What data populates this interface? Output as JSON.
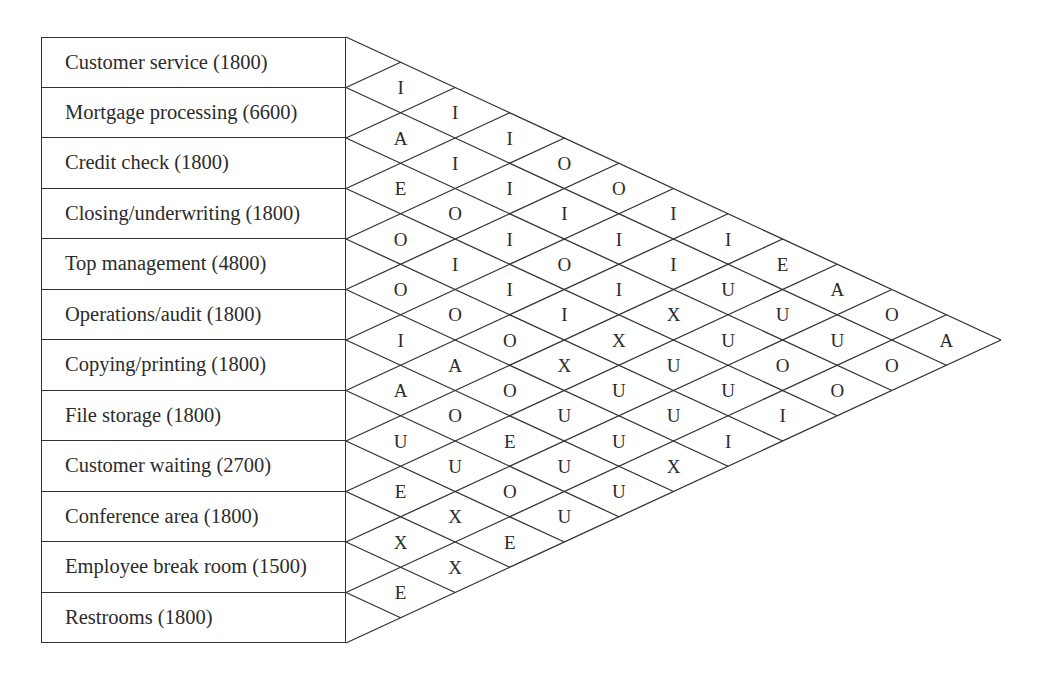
{
  "diagram": {
    "type": "activity-relationship-chart",
    "departments": [
      {
        "name": "Customer service",
        "area": 1800,
        "label": "Customer service (1800)"
      },
      {
        "name": "Mortgage processing",
        "area": 6600,
        "label": "Mortgage processing (6600)"
      },
      {
        "name": "Credit check",
        "area": 1800,
        "label": "Credit check (1800)"
      },
      {
        "name": "Closing/underwriting",
        "area": 1800,
        "label": "Closing/underwriting (1800)"
      },
      {
        "name": "Top management",
        "area": 4800,
        "label": "Top management (4800)"
      },
      {
        "name": "Operations/audit",
        "area": 1800,
        "label": "Operations/audit (1800)"
      },
      {
        "name": "Copying/printing",
        "area": 1800,
        "label": "Copying/printing (1800)"
      },
      {
        "name": "File storage",
        "area": 1800,
        "label": "File storage (1800)"
      },
      {
        "name": "Customer waiting",
        "area": 2700,
        "label": "Customer waiting (2700)"
      },
      {
        "name": "Conference area",
        "area": 1800,
        "label": "Conference area (1800)"
      },
      {
        "name": "Employee break room",
        "area": 1500,
        "label": "Employee break room (1500)"
      },
      {
        "name": "Restrooms",
        "area": 1800,
        "label": "Restrooms (1800)"
      }
    ],
    "relationships_note": "relationships[i][k] = code between department i and department i+k+1",
    "relationships": [
      [
        "I",
        "I",
        "I",
        "O",
        "O",
        "I",
        "I",
        "E",
        "A",
        "O",
        "A"
      ],
      [
        "A",
        "I",
        "I",
        "I",
        "I",
        "I",
        "U",
        "U",
        "U",
        "O"
      ],
      [
        "E",
        "O",
        "I",
        "O",
        "I",
        "X",
        "U",
        "O",
        "O"
      ],
      [
        "O",
        "I",
        "I",
        "I",
        "X",
        "U",
        "U",
        "I"
      ],
      [
        "O",
        "O",
        "O",
        "X",
        "U",
        "U",
        "I"
      ],
      [
        "I",
        "A",
        "O",
        "U",
        "U",
        "X"
      ],
      [
        "A",
        "O",
        "E",
        "U",
        "U"
      ],
      [
        "U",
        "U",
        "O",
        "U"
      ],
      [
        "E",
        "X",
        "E"
      ],
      [
        "X",
        "X"
      ],
      [
        "E"
      ]
    ],
    "colors": {
      "line": "#333333",
      "text": "#2b2b2b",
      "background": "#ffffff"
    }
  }
}
